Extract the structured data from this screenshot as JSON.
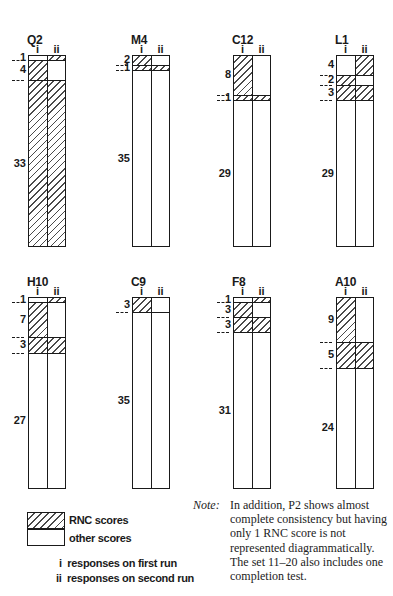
{
  "figure": {
    "column_labels": {
      "first": "i",
      "second": "ii"
    },
    "subjects": [
      {
        "name": "Q2",
        "segments": [
          {
            "value": 1,
            "i": "other",
            "ii": "rnc"
          },
          {
            "value": 4,
            "i": "rnc",
            "ii": "other"
          },
          {
            "value": 33,
            "i": "rnc",
            "ii": "rnc"
          }
        ]
      },
      {
        "name": "M4",
        "segments": [
          {
            "value": 2,
            "i": "rnc",
            "ii": "other"
          },
          {
            "value": 1,
            "i": "rnc",
            "ii": "rnc"
          },
          {
            "value": 35,
            "i": "other",
            "ii": "other"
          }
        ]
      },
      {
        "name": "C12",
        "segments": [
          {
            "value": 8,
            "i": "rnc",
            "ii": "other"
          },
          {
            "value": 1,
            "i": "rnc",
            "ii": "rnc"
          },
          {
            "value": 29,
            "i": "other",
            "ii": "other"
          }
        ]
      },
      {
        "name": "L1",
        "segments": [
          {
            "value": 4,
            "i": "other",
            "ii": "rnc"
          },
          {
            "value": 2,
            "i": "rnc",
            "ii": "other"
          },
          {
            "value": 3,
            "i": "rnc",
            "ii": "rnc"
          },
          {
            "value": 29,
            "i": "other",
            "ii": "other"
          }
        ]
      },
      {
        "name": "H10",
        "segments": [
          {
            "value": 1,
            "i": "other",
            "ii": "rnc"
          },
          {
            "value": 7,
            "i": "rnc",
            "ii": "other"
          },
          {
            "value": 3,
            "i": "rnc",
            "ii": "rnc"
          },
          {
            "value": 27,
            "i": "other",
            "ii": "other"
          }
        ]
      },
      {
        "name": "C9",
        "segments": [
          {
            "value": 3,
            "i": "rnc",
            "ii": "other"
          },
          {
            "value": 35,
            "i": "other",
            "ii": "other"
          }
        ]
      },
      {
        "name": "F8",
        "segments": [
          {
            "value": 1,
            "i": "other",
            "ii": "rnc"
          },
          {
            "value": 3,
            "i": "rnc",
            "ii": "other"
          },
          {
            "value": 3,
            "i": "rnc",
            "ii": "rnc"
          },
          {
            "value": 31,
            "i": "other",
            "ii": "other"
          }
        ]
      },
      {
        "name": "A10",
        "segments": [
          {
            "value": 9,
            "i": "rnc",
            "ii": "other"
          },
          {
            "value": 5,
            "i": "rnc",
            "ii": "rnc"
          },
          {
            "value": 24,
            "i": "other",
            "ii": "other"
          }
        ]
      }
    ]
  },
  "legend": {
    "rnc": "RNC scores",
    "other": "other scores",
    "first_run": "i  responses on first run",
    "second_run": "ii  responses on second run"
  },
  "note": {
    "label": "Note:",
    "text": "In addition, P2 shows almost complete consistency but having only 1 RNC score is not represented diagrammatically. The set 11–20 also includes one completion test."
  }
}
